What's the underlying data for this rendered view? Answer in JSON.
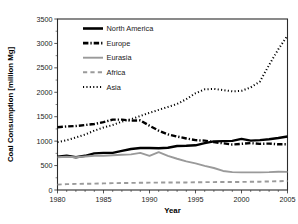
{
  "chart_data": {
    "type": "line",
    "title": "",
    "xlabel": "Year",
    "ylabel": "Coal Consumption [million Mg]",
    "xlim": [
      1980,
      2005
    ],
    "ylim": [
      0,
      3500
    ],
    "xticks": [
      1980,
      1985,
      1990,
      1995,
      2000,
      2005
    ],
    "yticks": [
      0,
      500,
      1000,
      1500,
      2000,
      2500,
      3000,
      3500
    ],
    "xtick_labels": [
      "1980",
      "1985",
      "1990",
      "1995",
      "2000",
      "2005"
    ],
    "ytick_labels": [
      "0",
      "500",
      "1000",
      "1500",
      "2000",
      "2500",
      "3000",
      "3500"
    ],
    "grid": false,
    "legend_position": "upper-left-inside",
    "x": [
      1980,
      1981,
      1982,
      1983,
      1984,
      1985,
      1986,
      1987,
      1988,
      1989,
      1990,
      1991,
      1992,
      1993,
      1994,
      1995,
      1996,
      1997,
      1998,
      1999,
      2000,
      2001,
      2002,
      2003,
      2004,
      2005
    ],
    "series": [
      {
        "name": "North America",
        "style": "solid",
        "color": "#000000",
        "width": 2.4,
        "values": [
          680,
          700,
          670,
          700,
          750,
          760,
          760,
          800,
          840,
          860,
          860,
          855,
          865,
          900,
          905,
          915,
          960,
          995,
          1000,
          1005,
          1045,
          1010,
          1020,
          1040,
          1065,
          1095
        ]
      },
      {
        "name": "Europe",
        "style": "dash-dot",
        "color": "#000000",
        "width": 2.4,
        "values": [
          1285,
          1300,
          1310,
          1330,
          1350,
          1390,
          1440,
          1440,
          1420,
          1425,
          1315,
          1215,
          1140,
          1095,
          1055,
          1020,
          1010,
          980,
          955,
          930,
          945,
          960,
          945,
          950,
          935,
          935
        ]
      },
      {
        "name": "Eurasia",
        "style": "solid",
        "color": "#9a9a9a",
        "width": 1.9,
        "values": [
          670,
          680,
          670,
          685,
          700,
          700,
          710,
          720,
          730,
          760,
          700,
          775,
          700,
          640,
          585,
          545,
          495,
          450,
          390,
          365,
          360,
          360,
          360,
          365,
          375,
          370
        ]
      },
      {
        "name": "Africa",
        "style": "dashed",
        "color": "#9a9a9a",
        "width": 1.9,
        "values": [
          110,
          120,
          125,
          128,
          130,
          135,
          140,
          142,
          145,
          148,
          150,
          152,
          152,
          155,
          155,
          158,
          160,
          162,
          163,
          163,
          165,
          168,
          170,
          175,
          180,
          185
        ]
      },
      {
        "name": "Asia",
        "style": "dotted",
        "color": "#000000",
        "width": 2.0,
        "values": [
          980,
          1020,
          1075,
          1135,
          1215,
          1280,
          1330,
          1400,
          1450,
          1515,
          1580,
          1640,
          1700,
          1760,
          1860,
          1980,
          2060,
          2070,
          2045,
          2020,
          2030,
          2100,
          2220,
          2560,
          2880,
          3160
        ]
      }
    ],
    "legend": [
      {
        "label": "North America",
        "style": "solid",
        "color": "#000000",
        "width": 2.6
      },
      {
        "label": "Europe",
        "style": "dash-dot",
        "color": "#000000",
        "width": 2.6
      },
      {
        "label": "Eurasia",
        "style": "solid",
        "color": "#9a9a9a",
        "width": 1.9
      },
      {
        "label": "Africa",
        "style": "dashed",
        "color": "#9a9a9a",
        "width": 1.9
      },
      {
        "label": "Asia",
        "style": "dotted",
        "color": "#000000",
        "width": 2.0
      }
    ]
  }
}
